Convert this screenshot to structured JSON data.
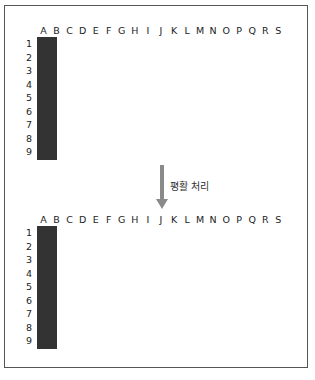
{
  "columns": [
    "A",
    "B",
    "C",
    "D",
    "E",
    "F",
    "G",
    "H",
    "I",
    "J",
    "K",
    "L",
    "M",
    "N",
    "O",
    "P",
    "Q",
    "R",
    "S"
  ],
  "rows": [
    "1",
    "2",
    "3",
    "4",
    "5",
    "6",
    "7",
    "8",
    "9"
  ],
  "arrow_label": "평활 처리",
  "colors": {
    "dark": "#555555",
    "shade_levels": {
      "0": "#ffffff",
      "1": "#efefef",
      "2": "#dcdcdc",
      "3": "#b8b8b8",
      "4": "#8f8f8f",
      "5": "#6e6e6e",
      "6": "#555555"
    },
    "arrow": "#8a8a8a",
    "grid_line": "#333333"
  },
  "top_grid": {
    "description": "Original binary pixel grid",
    "filled_cells": [
      "D2",
      "E2",
      "C3",
      "D3",
      "C4",
      "E4",
      "G4",
      "C5",
      "E5",
      "L8"
    ]
  },
  "bottom_grid": {
    "description": "Smoothed grid (shade levels 0-6)",
    "shaded_cells": {
      "C1": 1,
      "D1": 2,
      "E1": 2,
      "C2": 1,
      "D2": 6,
      "E2": 5,
      "F2": 1,
      "B3": 2,
      "C3": 5,
      "D3": 6,
      "E3": 3,
      "F3": 1,
      "G3": 1,
      "H3": 1,
      "B4": 2,
      "C4": 5,
      "D4": 6,
      "E4": 5,
      "F4": 1,
      "G4": 3,
      "H4": 1,
      "B5": 1,
      "C5": 5,
      "D5": 3,
      "E5": 5,
      "F5": 1,
      "G5": 1,
      "B6": 1,
      "C6": 1,
      "D6": 1,
      "E6": 1,
      "F6": 1,
      "K7": 1,
      "L7": 1,
      "M7": 1,
      "K8": 1,
      "L8": 3,
      "M8": 1,
      "K9": 1,
      "L9": 1,
      "M9": 1
    }
  }
}
